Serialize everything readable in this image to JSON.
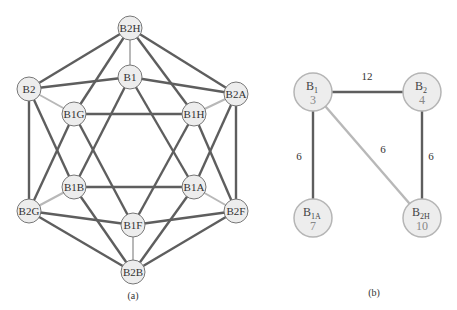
{
  "panel_a": {
    "caption": "(a)",
    "nodes": [
      {
        "id": "B2H",
        "label": "B2H",
        "x": 130,
        "y": 28
      },
      {
        "id": "B1",
        "label": "B1",
        "x": 130,
        "y": 77
      },
      {
        "id": "B2",
        "label": "B2",
        "x": 29,
        "y": 89
      },
      {
        "id": "B2A",
        "label": "B2A",
        "x": 236,
        "y": 94
      },
      {
        "id": "B1G",
        "label": "B1G",
        "x": 74,
        "y": 114
      },
      {
        "id": "B1H",
        "label": "B1H",
        "x": 194,
        "y": 114
      },
      {
        "id": "B1B",
        "label": "B1B",
        "x": 74,
        "y": 187
      },
      {
        "id": "B1A",
        "label": "B1A",
        "x": 194,
        "y": 187
      },
      {
        "id": "B2G",
        "label": "B2G",
        "x": 29,
        "y": 211
      },
      {
        "id": "B2F",
        "label": "B2F",
        "x": 236,
        "y": 211
      },
      {
        "id": "B1F",
        "label": "B1F",
        "x": 133,
        "y": 225
      },
      {
        "id": "B2B",
        "label": "B2B",
        "x": 133,
        "y": 272
      }
    ],
    "edges_dark": [
      [
        "B2H",
        "B2"
      ],
      [
        "B2H",
        "B2A"
      ],
      [
        "B2H",
        "B1G"
      ],
      [
        "B2H",
        "B1H"
      ],
      [
        "B1",
        "B2"
      ],
      [
        "B1",
        "B2A"
      ],
      [
        "B1",
        "B1B"
      ],
      [
        "B1",
        "B1A"
      ],
      [
        "B2",
        "B2G"
      ],
      [
        "B2",
        "B1B"
      ],
      [
        "B2A",
        "B2F"
      ],
      [
        "B2A",
        "B1A"
      ],
      [
        "B1G",
        "B1H"
      ],
      [
        "B1G",
        "B2G"
      ],
      [
        "B1G",
        "B1F"
      ],
      [
        "B1H",
        "B2F"
      ],
      [
        "B1H",
        "B1F"
      ],
      [
        "B1B",
        "B1A"
      ],
      [
        "B1B",
        "B2B"
      ],
      [
        "B1A",
        "B2B"
      ],
      [
        "B2G",
        "B1F"
      ],
      [
        "B2G",
        "B2B"
      ],
      [
        "B2F",
        "B1F"
      ],
      [
        "B2F",
        "B2B"
      ]
    ],
    "edges_light": [
      [
        "B2H",
        "B1"
      ],
      [
        "B2",
        "B1G"
      ],
      [
        "B2A",
        "B1H"
      ],
      [
        "B2G",
        "B1B"
      ],
      [
        "B2F",
        "B1A"
      ],
      [
        "B1F",
        "B2B"
      ]
    ]
  },
  "panel_b": {
    "caption": "(b)",
    "nodes": [
      {
        "id": "B1",
        "base": "B",
        "sub": "1",
        "value": "3",
        "x": 313,
        "y": 92
      },
      {
        "id": "B2",
        "base": "B",
        "sub": "2",
        "value": "4",
        "x": 422,
        "y": 92
      },
      {
        "id": "B1A",
        "base": "B",
        "sub": "1A",
        "value": "7",
        "x": 313,
        "y": 218
      },
      {
        "id": "B2H",
        "base": "B",
        "sub": "2H",
        "value": "10",
        "x": 422,
        "y": 218
      }
    ],
    "edges": [
      {
        "from": "B1",
        "to": "B2",
        "weight": "12",
        "style": "dark",
        "lx": 367,
        "ly": 80
      },
      {
        "from": "B1",
        "to": "B1A",
        "weight": "6",
        "style": "dark",
        "lx": 299,
        "ly": 160
      },
      {
        "from": "B1",
        "to": "B2H",
        "weight": "6",
        "style": "light",
        "lx": 383,
        "ly": 153
      },
      {
        "from": "B2",
        "to": "B2H",
        "weight": "6",
        "style": "dark",
        "lx": 431,
        "ly": 160
      }
    ]
  },
  "colors": {
    "dark_edge": "#5e5e5e",
    "light_edge": "#b8b8b8",
    "node_fill": "#ededed",
    "node_stroke": "#777777",
    "b_node_stroke": "#b5b5b5"
  }
}
